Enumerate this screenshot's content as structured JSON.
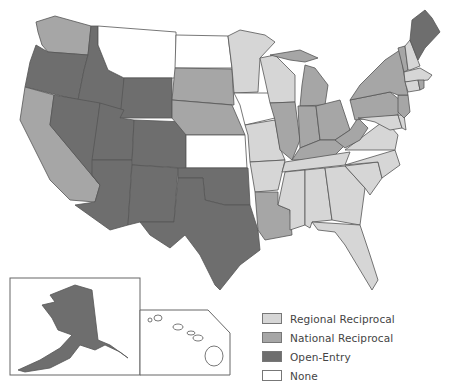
{
  "categories": {
    "regional": {
      "label": "Regional Reciprocal",
      "color": "#d6d6d6"
    },
    "national": {
      "label": "National Reciprocal",
      "color": "#a6a6a6"
    },
    "open": {
      "label": "Open-Entry",
      "color": "#6e6e6e"
    },
    "none": {
      "label": "None",
      "color": "#ffffff"
    }
  },
  "legend": {
    "items": [
      {
        "label": "Regional Reciprocal",
        "color": "#d6d6d6"
      },
      {
        "label": "National Reciprocal",
        "color": "#a6a6a6"
      },
      {
        "label": "Open-Entry",
        "color": "#6e6e6e"
      },
      {
        "label": "None",
        "color": "#ffffff"
      }
    ]
  },
  "states": {
    "WA": "national",
    "OR": "open",
    "CA": "national",
    "ID": "open",
    "NV": "open",
    "MT": "none",
    "WY": "open",
    "UT": "open",
    "AZ": "open",
    "CO": "open",
    "NM": "open",
    "ND": "none",
    "SD": "national",
    "NE": "national",
    "KS": "none",
    "OK": "open",
    "TX": "open",
    "MN": "regional",
    "IA": "none",
    "MO": "regional",
    "AR": "regional",
    "LA": "national",
    "WI": "regional",
    "IL": "national",
    "MI": "national",
    "IN": "national",
    "OH": "national",
    "KY": "national",
    "TN": "regional",
    "MS": "regional",
    "AL": "regional",
    "GA": "regional",
    "FL": "regional",
    "SC": "regional",
    "NC": "regional",
    "VA": "regional",
    "WV": "national",
    "MD": "regional",
    "DE": "regional",
    "PA": "national",
    "NJ": "national",
    "NY": "national",
    "CT": "regional",
    "RI": "national",
    "MA": "regional",
    "VT": "national",
    "NH": "regional",
    "ME": "open",
    "AK": "open",
    "HI": "none"
  }
}
